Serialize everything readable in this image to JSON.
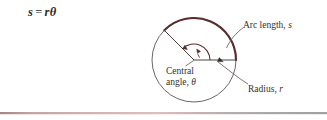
{
  "figure": {
    "formula": {
      "lhs": "s",
      "operator": "=",
      "rhs": "rθ",
      "full": "s = rθ"
    },
    "labels": {
      "arc_length": "Arc length,",
      "arc_length_var": "s",
      "radius": "Radius,",
      "radius_var": "r",
      "central_angle_line1": "Central",
      "central_angle_line2": "angle,",
      "central_angle_var": "θ"
    },
    "colors": {
      "arc_stroke": "#5a2b2b",
      "circle_stroke": "#6d6663",
      "leader_stroke": "#6d6663",
      "angle_arc_stroke": "#5a2b2b",
      "text": "#32302f",
      "formula_text": "#2b2b2b",
      "rule_left": "#c9a6a6",
      "rule_right": "#949494"
    },
    "geometry": {
      "center_x": 194,
      "center_y": 60,
      "radius_px": 42,
      "radius_line_angle_deg": 0,
      "second_radius_angle_deg": 135,
      "arc_sweep_deg": 135
    }
  }
}
